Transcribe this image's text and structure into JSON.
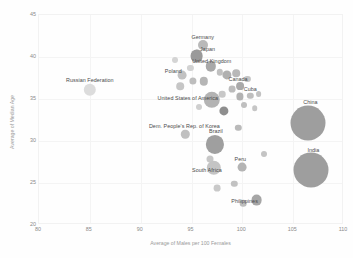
{
  "chart_data": {
    "type": "scatter",
    "title": "",
    "xlabel": "Average of Males per 100 Females",
    "ylabel": "Average of Median Age",
    "xlim": [
      80,
      110
    ],
    "ylim": [
      20,
      45
    ],
    "xticks": [
      80,
      85,
      90,
      95,
      100,
      105,
      110
    ],
    "yticks": [
      20,
      25,
      30,
      35,
      40,
      45
    ],
    "grid": true,
    "legend": "none",
    "size_encoding": "population",
    "points": [
      {
        "label": "Germany",
        "x": 96.1,
        "y": 41.4,
        "r": 5.0,
        "color": "#b9b9b9",
        "label_dx": 0,
        "label_dy": -8
      },
      {
        "label": "Japan",
        "x": 95.5,
        "y": 40.1,
        "r": 6.4,
        "color": "#9a9a9a",
        "label_dx": 11,
        "label_dy": -7
      },
      {
        "label": "United Kingdom",
        "x": 96.9,
        "y": 38.9,
        "r": 5.2,
        "color": "#a8a8a8",
        "label_dx": 1,
        "label_dy": -5
      },
      {
        "label": "Poland",
        "x": 94.1,
        "y": 37.8,
        "r": 4.4,
        "color": "#c2c2c2",
        "label_dx": -9,
        "label_dy": -4
      },
      {
        "label": "Canada",
        "x": 98.5,
        "y": 37.9,
        "r": 4.6,
        "color": "#b0b0b0",
        "label_dx": 11,
        "label_dy": 4
      },
      {
        "label": "Cuba",
        "x": 99.8,
        "y": 36.5,
        "r": 3.9,
        "color": "#a9a9a9",
        "label_dx": 10,
        "label_dy": 3
      },
      {
        "label": "United States of America",
        "x": 97.0,
        "y": 34.9,
        "r": 8.2,
        "color": "#b3b3b3",
        "label_dx": -24,
        "label_dy": -2
      },
      {
        "label": "Russian Federation",
        "x": 85.0,
        "y": 36.1,
        "r": 6.2,
        "color": "#dcdcdc",
        "label_dx": 0,
        "label_dy": -10
      },
      {
        "label": "China",
        "x": 106.5,
        "y": 32.2,
        "r": 17.5,
        "color": "#9e9e9e",
        "label_dx": 2,
        "label_dy": -21
      },
      {
        "label": "India",
        "x": 106.8,
        "y": 26.6,
        "r": 17.5,
        "color": "#9e9e9e",
        "label_dx": 2,
        "label_dy": -20
      },
      {
        "label": "Dem. People's Rep. of Korea",
        "x": 94.4,
        "y": 30.8,
        "r": 4.2,
        "color": "#c0c0c0",
        "label_dx": -1,
        "label_dy": -8
      },
      {
        "label": "Brazil",
        "x": 97.3,
        "y": 29.6,
        "r": 9.1,
        "color": "#9f9f9f",
        "label_dx": 1,
        "label_dy": -13
      },
      {
        "label": "Peru",
        "x": 100.0,
        "y": 26.9,
        "r": 4.4,
        "color": "#b4b4b4",
        "label_dx": -2,
        "label_dy": -8
      },
      {
        "label": "South Africa",
        "x": 97.2,
        "y": 26.8,
        "r": 7.2,
        "color": "#c4c4c4",
        "label_dx": -7,
        "label_dy": 2
      },
      {
        "label": "Philippines",
        "x": 101.4,
        "y": 23.0,
        "r": 5.4,
        "color": "#a6a6a6",
        "label_dx": -12,
        "label_dy": 1
      }
    ],
    "unlabeled_points": [
      {
        "x": 95.6,
        "y": 40.5,
        "r": 3.4,
        "color": "#c9c9c9"
      },
      {
        "x": 94.9,
        "y": 38.7,
        "r": 3.1,
        "color": "#d2d2d2"
      },
      {
        "x": 93.9,
        "y": 36.5,
        "r": 3.8,
        "color": "#c6c6c6"
      },
      {
        "x": 95.1,
        "y": 37.2,
        "r": 3.6,
        "color": "#bdbdbd"
      },
      {
        "x": 96.2,
        "y": 37.1,
        "r": 4.2,
        "color": "#b5b5b5"
      },
      {
        "x": 97.8,
        "y": 38.2,
        "r": 3.2,
        "color": "#c0c0c0"
      },
      {
        "x": 99.4,
        "y": 38.1,
        "r": 3.8,
        "color": "#b8b8b8"
      },
      {
        "x": 100.5,
        "y": 37.4,
        "r": 3.1,
        "color": "#c4c4c4"
      },
      {
        "x": 99.0,
        "y": 36.2,
        "r": 3.4,
        "color": "#bcbcbc"
      },
      {
        "x": 98.0,
        "y": 35.6,
        "r": 3.3,
        "color": "#c8c8c8"
      },
      {
        "x": 99.8,
        "y": 35.3,
        "r": 3.6,
        "color": "#b2b2b2"
      },
      {
        "x": 100.8,
        "y": 35.4,
        "r": 3.2,
        "color": "#bebebe"
      },
      {
        "x": 101.6,
        "y": 35.6,
        "r": 2.9,
        "color": "#c2c2c2"
      },
      {
        "x": 98.2,
        "y": 33.6,
        "r": 4.6,
        "color": "#8e8e8e"
      },
      {
        "x": 100.2,
        "y": 34.3,
        "r": 3.0,
        "color": "#bfbfbf"
      },
      {
        "x": 101.2,
        "y": 33.9,
        "r": 2.8,
        "color": "#c6c6c6"
      },
      {
        "x": 95.7,
        "y": 34.1,
        "r": 3.0,
        "color": "#cfcfcf"
      },
      {
        "x": 99.6,
        "y": 31.6,
        "r": 3.2,
        "color": "#bababa"
      },
      {
        "x": 96.8,
        "y": 27.9,
        "r": 3.5,
        "color": "#c7c7c7"
      },
      {
        "x": 99.2,
        "y": 24.9,
        "r": 3.2,
        "color": "#c2c2c2"
      },
      {
        "x": 97.5,
        "y": 24.4,
        "r": 3.4,
        "color": "#c9c9c9"
      },
      {
        "x": 100.1,
        "y": 22.6,
        "r": 3.3,
        "color": "#bdbdbd"
      },
      {
        "x": 102.1,
        "y": 28.4,
        "r": 3.0,
        "color": "#c4c4c4"
      },
      {
        "x": 93.4,
        "y": 39.6,
        "r": 3.0,
        "color": "#d4d4d4"
      }
    ]
  }
}
